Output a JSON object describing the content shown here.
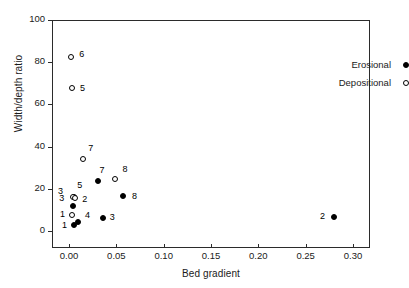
{
  "chart_data": {
    "type": "scatter",
    "title": "",
    "xlabel": "Bed gradient",
    "ylabel": "Width/depth ratio",
    "xlim": [
      -0.018,
      0.318
    ],
    "ylim": [
      -8,
      100
    ],
    "xticks": [
      "0.00",
      "0.05",
      "0.10",
      "0.15",
      "0.20",
      "0.25",
      "0.30"
    ],
    "xtick_values": [
      0.0,
      0.05,
      0.1,
      0.15,
      0.2,
      0.25,
      0.3
    ],
    "yticks": [
      "0",
      "20",
      "40",
      "60",
      "80",
      "100"
    ],
    "ytick_values": [
      0,
      20,
      40,
      60,
      80,
      100
    ],
    "grid": false,
    "legend_position": "top-right",
    "series": [
      {
        "name": "Erosional",
        "marker": "filled-circle",
        "color": "#000000",
        "points": [
          {
            "label": "5",
            "x": 0.0045,
            "y": 16.5,
            "label_dx": 3,
            "label_dy": -15
          },
          {
            "label": "3",
            "x": 0.0035,
            "y": 12.5,
            "label_dx": -14,
            "label_dy": -11
          },
          {
            "label": "1",
            "x": 0.0042,
            "y": 3.5,
            "label_dx": -12,
            "label_dy": -3
          },
          {
            "label": "4",
            "x": 0.0085,
            "y": 5.0,
            "label_dx": 7,
            "label_dy": -10
          },
          {
            "label": "3",
            "x": 0.0345,
            "y": 6.5,
            "label_dx": 7,
            "label_dy": -4
          },
          {
            "label": "7",
            "x": 0.03,
            "y": 24.0,
            "label_dx": 1,
            "label_dy": -14
          },
          {
            "label": "8",
            "x": 0.056,
            "y": 17.0,
            "label_dx": 9,
            "label_dy": -3
          },
          {
            "label": "2",
            "x": 0.279,
            "y": 7.0,
            "label_dx": -14,
            "label_dy": -4
          }
        ]
      },
      {
        "name": "Depositional",
        "marker": "open-circle",
        "color": "#000000",
        "points": [
          {
            "label": "6",
            "x": 0.0012,
            "y": 83.0,
            "label_dx": 8,
            "label_dy": -6
          },
          {
            "label": "5",
            "x": 0.0022,
            "y": 68.5,
            "label_dx": 8,
            "label_dy": -3
          },
          {
            "label": "7",
            "x": 0.014,
            "y": 34.5,
            "label_dx": 5,
            "label_dy": -14
          },
          {
            "label": "3",
            "x": 0.003,
            "y": 16.5,
            "label_dx": -15,
            "label_dy": -9
          },
          {
            "label": "2",
            "x": 0.0055,
            "y": 16.0,
            "label_dx": 7,
            "label_dy": -2
          },
          {
            "label": "1",
            "x": 0.0022,
            "y": 8.0,
            "label_dx": -12,
            "label_dy": -4
          },
          {
            "label": "8",
            "x": 0.048,
            "y": 25.0,
            "label_dx": 7,
            "label_dy": -13
          }
        ]
      }
    ]
  }
}
